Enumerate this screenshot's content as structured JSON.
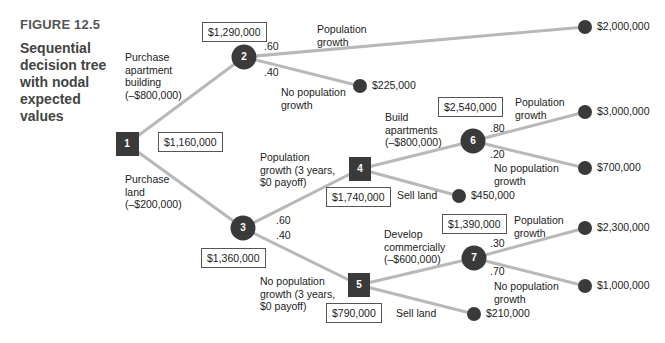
{
  "figure": {
    "label": "FIGURE 12.5",
    "caption": "Sequential decision tree with nodal expected values"
  },
  "colors": {
    "branch_line": "#b8b8b8",
    "node_fill": "#3a3a3a",
    "text": "#222222",
    "figure_label": "#555555"
  },
  "nodes": [
    {
      "id": "1",
      "type": "decision",
      "expected_value": "$1,160,000"
    },
    {
      "id": "2",
      "type": "chance",
      "expected_value": "$1,290,000"
    },
    {
      "id": "3",
      "type": "chance",
      "expected_value": "$1,360,000"
    },
    {
      "id": "4",
      "type": "decision",
      "expected_value": "$1,740,000"
    },
    {
      "id": "5",
      "type": "decision",
      "expected_value": "$790,000"
    },
    {
      "id": "6",
      "type": "chance",
      "expected_value": "$2,540,000"
    },
    {
      "id": "7",
      "type": "chance",
      "expected_value": "$1,390,000"
    }
  ],
  "branches": {
    "purchase_apartment": [
      "Purchase",
      "apartment",
      "building",
      "(–$800,000)"
    ],
    "purchase_land": [
      "Purchase",
      "land",
      "(–$200,000)"
    ],
    "n2_growth": [
      "Population",
      "growth"
    ],
    "n2_no_growth": [
      "No population",
      "growth"
    ],
    "n3_growth": [
      "Population",
      "growth (3 years,",
      "$0 payoff)"
    ],
    "n3_no_growth": [
      "No population",
      "growth (3 years,",
      "$0 payoff)"
    ],
    "build_apartments": [
      "Build",
      "apartments",
      "(–$800,000)"
    ],
    "n4_sell_land": "Sell land",
    "n6_growth": [
      "Population",
      "growth"
    ],
    "n6_no_growth": [
      "No population",
      "growth"
    ],
    "develop_commercially": [
      "Develop",
      "commercially",
      "(–$600,000)"
    ],
    "n5_sell_land": "Sell land",
    "n7_growth": [
      "Population",
      "growth"
    ],
    "n7_no_growth": [
      "No population",
      "growth"
    ]
  },
  "probabilities": {
    "n2_growth": ".60",
    "n2_no_growth": ".40",
    "n3_growth": ".60",
    "n3_no_growth": ".40",
    "n6_growth": ".80",
    "n6_no_growth": ".20",
    "n7_growth": ".30",
    "n7_no_growth": ".70"
  },
  "payoffs": {
    "n2_growth": "$2,000,000",
    "n2_no_growth": "$225,000",
    "n4_sell_land": "$450,000",
    "n6_growth": "$3,000,000",
    "n6_no_growth": "$700,000",
    "n5_sell_land": "$210,000",
    "n7_growth": "$2,300,000",
    "n7_no_growth": "$1,000,000"
  }
}
